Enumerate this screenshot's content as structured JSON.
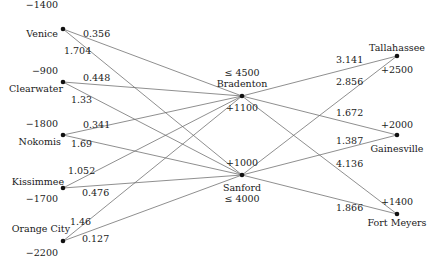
{
  "diagram": {
    "type": "transshipment-network",
    "nodes": {
      "venice": {
        "label": "Venice",
        "value": "−1400",
        "x": 63,
        "y": 29
      },
      "clearwater": {
        "label": "Clearwater",
        "value": "−900",
        "x": 63,
        "y": 82
      },
      "nokomis": {
        "label": "Nokomis",
        "value": "−1800",
        "x": 63,
        "y": 135
      },
      "kissimmee": {
        "label": "Kissimmee",
        "value": "−1700",
        "x": 63,
        "y": 188
      },
      "orange_city": {
        "label": "Orange City",
        "value": "−2200",
        "x": 63,
        "y": 241
      },
      "bradenton": {
        "label": "Bradenton",
        "value": "+1100",
        "capacity": "≤ 4500",
        "x": 242,
        "y": 96
      },
      "sanford": {
        "label": "Sanford",
        "value": "+1000",
        "capacity": "≤ 4000",
        "x": 242,
        "y": 175
      },
      "tallahassee": {
        "label": "Tallahassee",
        "value": "+2500",
        "x": 397,
        "y": 56
      },
      "gainesville": {
        "label": "Gainesville",
        "value": "+2000",
        "x": 397,
        "y": 135
      },
      "fort_meyers": {
        "label": "Fort Meyers",
        "value": "+1400",
        "x": 397,
        "y": 214
      }
    },
    "edges": [
      {
        "from": "venice",
        "to": "bradenton",
        "cost": "0.356"
      },
      {
        "from": "venice",
        "to": "sanford",
        "cost": "1.704"
      },
      {
        "from": "clearwater",
        "to": "bradenton",
        "cost": "0.448"
      },
      {
        "from": "clearwater",
        "to": "sanford",
        "cost": "1.33"
      },
      {
        "from": "nokomis",
        "to": "bradenton",
        "cost": "0.341"
      },
      {
        "from": "nokomis",
        "to": "sanford",
        "cost": "1.69"
      },
      {
        "from": "kissimmee",
        "to": "bradenton",
        "cost": "1.052"
      },
      {
        "from": "kissimmee",
        "to": "sanford",
        "cost": "0.476"
      },
      {
        "from": "orange_city",
        "to": "bradenton",
        "cost": "1.46"
      },
      {
        "from": "orange_city",
        "to": "sanford",
        "cost": "0.127"
      },
      {
        "from": "bradenton",
        "to": "tallahassee",
        "cost": "3.141"
      },
      {
        "from": "bradenton",
        "to": "gainesville",
        "cost": "1.672"
      },
      {
        "from": "bradenton",
        "to": "fort_meyers",
        "cost": "4.136"
      },
      {
        "from": "sanford",
        "to": "tallahassee",
        "cost": "2.856"
      },
      {
        "from": "sanford",
        "to": "gainesville",
        "cost": "1.387"
      },
      {
        "from": "sanford",
        "to": "fort_meyers",
        "cost": "1.866"
      }
    ]
  }
}
